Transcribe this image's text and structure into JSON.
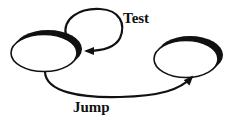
{
  "diagram": {
    "type": "state-transition",
    "states": [
      {
        "id": "left-state",
        "label": ""
      },
      {
        "id": "right-state",
        "label": ""
      }
    ],
    "transitions": [
      {
        "from": "left-state",
        "to": "left-state",
        "label": "Test"
      },
      {
        "from": "left-state",
        "to": "right-state",
        "label": "Jump"
      }
    ],
    "labels": {
      "test": "Test",
      "jump": "Jump"
    },
    "colors": {
      "stroke": "#111111",
      "fill": "#ffffff",
      "background": "#ffffff"
    }
  }
}
